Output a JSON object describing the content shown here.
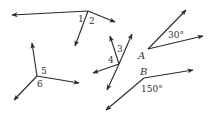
{
  "diagram": {
    "title": "",
    "colors": {
      "stroke": "#2a2a2a",
      "text": "#333333",
      "background": "#ffffff"
    },
    "figures": [
      {
        "id": "angles-1-2",
        "vertex": [
          88,
          11
        ],
        "rays": [
          [
            12,
            15
          ],
          [
            115,
            22
          ],
          [
            75,
            46
          ]
        ],
        "labels": [
          {
            "text": "1",
            "pos": [
              78,
              22
            ]
          },
          {
            "text": "2",
            "pos": [
              89,
              24
            ]
          }
        ]
      },
      {
        "id": "angles-3-4",
        "vertex": [
          119,
          64
        ],
        "rays": [
          [
            110,
            36
          ],
          [
            132,
            34
          ],
          [
            93,
            73
          ],
          [
            107,
            90
          ]
        ],
        "labels": [
          {
            "text": "3",
            "pos": [
              117,
              52
            ]
          },
          {
            "text": "4",
            "pos": [
              108,
              63
            ]
          }
        ]
      },
      {
        "id": "angles-5-6",
        "vertex": [
          37,
          76
        ],
        "rays": [
          [
            32,
            43
          ],
          [
            79,
            83
          ],
          [
            14,
            100
          ]
        ],
        "labels": [
          {
            "text": "5",
            "pos": [
              41,
              74
            ]
          },
          {
            "text": "6",
            "pos": [
              37,
              87
            ]
          }
        ]
      },
      {
        "id": "angle-A",
        "vertex": [
          148,
          49
        ],
        "rays": [
          [
            186,
            10
          ],
          [
            203,
            36
          ]
        ],
        "vertex_label": {
          "text": "A",
          "pos": [
            138,
            59
          ]
        },
        "labels": [
          {
            "text": "30°",
            "pos": [
              168,
              38
            ]
          }
        ]
      },
      {
        "id": "angle-B",
        "vertex": [
          144,
          78
        ],
        "rays": [
          [
            193,
            70
          ],
          [
            106,
            110
          ]
        ],
        "vertex_label": {
          "text": "B",
          "pos": [
            140,
            75
          ]
        },
        "labels": [
          {
            "text": "150°",
            "pos": [
              141,
              92
            ]
          }
        ]
      }
    ]
  }
}
